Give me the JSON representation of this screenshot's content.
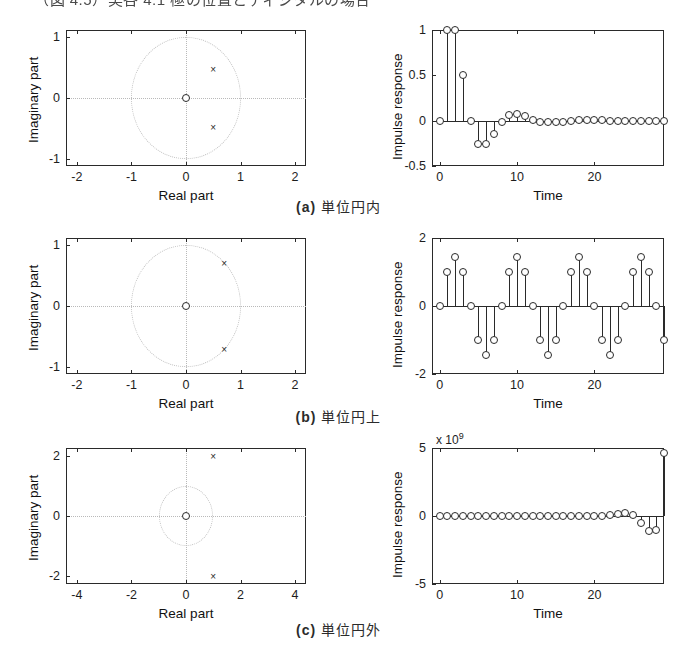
{
  "page": {
    "top_caption": "（図 4.5）実各 4.1 極の位置とディジタルの場合"
  },
  "panels": [
    {
      "id": "a",
      "caption_tag": "(a)",
      "caption_text": "単位円内",
      "pole_zero": {
        "xlabel": "Real part",
        "ylabel": "Imaginary part",
        "xlim": [
          -2.2,
          2.2
        ],
        "ylim": [
          -1.12,
          1.12
        ],
        "xticks": [
          -2,
          -1,
          0,
          1,
          2
        ],
        "xticklabels": [
          "-2",
          "-1",
          "0",
          "1",
          "2"
        ],
        "yticks": [
          -1,
          0,
          1
        ],
        "yticklabels": [
          "-1",
          "0",
          "1"
        ],
        "unit_circle_radius": 1,
        "zeros": [
          [
            0,
            0
          ]
        ],
        "poles": [
          [
            0.5,
            0.48
          ],
          [
            0.5,
            -0.48
          ]
        ]
      },
      "impulse": {
        "xlabel": "Time",
        "ylabel": "Impulse response",
        "xlim": [
          -1,
          29
        ],
        "ylim": [
          -0.5,
          1.0
        ],
        "xticks": [
          0,
          10,
          20
        ],
        "xticklabels": [
          "0",
          "10",
          "20"
        ],
        "yticks": [
          -0.5,
          0,
          0.5,
          1
        ],
        "yticklabels": [
          "-0.5",
          "0",
          "0.5",
          "1"
        ],
        "multiplier": "",
        "values": [
          0,
          1.0,
          1.0,
          0.5,
          0.0,
          -0.26,
          -0.26,
          -0.15,
          -0.02,
          0.06,
          0.075,
          0.055,
          0.01,
          -0.01,
          -0.02,
          -0.02,
          -0.01,
          0.0,
          0.005,
          0.006,
          0.005,
          0.002,
          0.0,
          0.0,
          0.0,
          0.0,
          0.0,
          0.0,
          0.0,
          0.0
        ]
      }
    },
    {
      "id": "b",
      "caption_tag": "(b)",
      "caption_text": "単位円上",
      "pole_zero": {
        "xlabel": "Real part",
        "ylabel": "Imaginary part",
        "xlim": [
          -2.2,
          2.2
        ],
        "ylim": [
          -1.12,
          1.12
        ],
        "xticks": [
          -2,
          -1,
          0,
          1,
          2
        ],
        "xticklabels": [
          "-2",
          "-1",
          "0",
          "1",
          "2"
        ],
        "yticks": [
          -1,
          0,
          1
        ],
        "yticklabels": [
          "-1",
          "0",
          "1"
        ],
        "unit_circle_radius": 1,
        "zeros": [
          [
            0,
            0
          ]
        ],
        "poles": [
          [
            0.7,
            0.71
          ],
          [
            0.7,
            -0.71
          ]
        ]
      },
      "impulse": {
        "xlabel": "Time",
        "ylabel": "Impulse response",
        "xlim": [
          -1,
          29
        ],
        "ylim": [
          -2,
          2
        ],
        "xticks": [
          0,
          10,
          20
        ],
        "xticklabels": [
          "0",
          "10",
          "20"
        ],
        "yticks": [
          -2,
          0,
          2
        ],
        "yticklabels": [
          "-2",
          "0",
          "2"
        ],
        "multiplier": "",
        "values": [
          0,
          1.0,
          1.45,
          1.0,
          0,
          -1.0,
          -1.45,
          -1.0,
          0,
          1.0,
          1.45,
          1.0,
          0,
          -1.0,
          -1.45,
          -1.0,
          0,
          1.0,
          1.45,
          1.0,
          0,
          -1.0,
          -1.45,
          -1.0,
          0,
          1.0,
          1.45,
          1.0,
          0,
          -1.0
        ]
      }
    },
    {
      "id": "c",
      "caption_tag": "(c)",
      "caption_text": "単位円外",
      "pole_zero": {
        "xlabel": "Real part",
        "ylabel": "Imaginary part",
        "xlim": [
          -4.4,
          4.4
        ],
        "ylim": [
          -2.25,
          2.25
        ],
        "xticks": [
          -4,
          -2,
          0,
          2,
          4
        ],
        "xticklabels": [
          "-4",
          "-2",
          "0",
          "2",
          "4"
        ],
        "yticks": [
          -2,
          0,
          2
        ],
        "yticklabels": [
          "-2",
          "0",
          "2"
        ],
        "unit_circle_radius": 1,
        "zeros": [
          [
            0,
            0
          ]
        ],
        "poles": [
          [
            1.0,
            2.0
          ],
          [
            1.0,
            -2.0
          ]
        ]
      },
      "impulse": {
        "xlabel": "Time",
        "ylabel": "Impulse response",
        "xlim": [
          -1,
          29
        ],
        "ylim": [
          -5,
          5
        ],
        "xticks": [
          0,
          10,
          20
        ],
        "xticklabels": [
          "0",
          "10",
          "20"
        ],
        "yticks": [
          -5,
          0,
          5
        ],
        "yticklabels": [
          "-5",
          "0",
          "5"
        ],
        "multiplier_prefix": "x 10",
        "multiplier_exponent": "9",
        "values": [
          0,
          0,
          0,
          0,
          0,
          0,
          0,
          0,
          0,
          0,
          0,
          0,
          0,
          0,
          0,
          0,
          0,
          0,
          0,
          0,
          0.02,
          0.03,
          0.06,
          0.12,
          0.22,
          0.05,
          -0.55,
          -1.1,
          -1.05,
          4.65
        ]
      }
    }
  ],
  "chart_data": {
    "type": "scatter",
    "subplots": [
      {
        "name": "a-pole-zero",
        "type": "scatter",
        "xlabel": "Real part",
        "ylabel": "Imaginary part",
        "xlim": [
          -2.2,
          2.2
        ],
        "ylim": [
          -1.12,
          1.12
        ],
        "poles_x": [
          0.5,
          0.5
        ],
        "poles_y": [
          0.48,
          -0.48
        ],
        "zeros_x": [
          0
        ],
        "zeros_y": [
          0
        ],
        "unit_circle": true
      },
      {
        "name": "a-impulse",
        "type": "line",
        "xlabel": "Time",
        "ylabel": "Impulse response",
        "x": [
          0,
          1,
          2,
          3,
          4,
          5,
          6,
          7,
          8,
          9,
          10,
          11,
          12,
          13,
          14,
          15,
          16,
          17,
          18,
          19,
          20,
          21,
          22,
          23,
          24,
          25,
          26,
          27,
          28,
          29
        ],
        "values": [
          0,
          1.0,
          1.0,
          0.5,
          0.0,
          -0.26,
          -0.26,
          -0.15,
          -0.02,
          0.06,
          0.075,
          0.055,
          0.01,
          -0.01,
          -0.02,
          -0.02,
          -0.01,
          0.0,
          0.005,
          0.006,
          0.005,
          0.002,
          0,
          0,
          0,
          0,
          0,
          0,
          0,
          0
        ],
        "ylim": [
          -0.5,
          1.0
        ]
      },
      {
        "name": "b-pole-zero",
        "type": "scatter",
        "xlabel": "Real part",
        "ylabel": "Imaginary part",
        "xlim": [
          -2.2,
          2.2
        ],
        "ylim": [
          -1.12,
          1.12
        ],
        "poles_x": [
          0.7,
          0.7
        ],
        "poles_y": [
          0.71,
          -0.71
        ],
        "zeros_x": [
          0
        ],
        "zeros_y": [
          0
        ],
        "unit_circle": true
      },
      {
        "name": "b-impulse",
        "type": "line",
        "xlabel": "Time",
        "ylabel": "Impulse response",
        "x": [
          0,
          1,
          2,
          3,
          4,
          5,
          6,
          7,
          8,
          9,
          10,
          11,
          12,
          13,
          14,
          15,
          16,
          17,
          18,
          19,
          20,
          21,
          22,
          23,
          24,
          25,
          26,
          27,
          28,
          29
        ],
        "values": [
          0,
          1.0,
          1.45,
          1.0,
          0,
          -1.0,
          -1.45,
          -1.0,
          0,
          1.0,
          1.45,
          1.0,
          0,
          -1.0,
          -1.45,
          -1.0,
          0,
          1.0,
          1.45,
          1.0,
          0,
          -1.0,
          -1.45,
          -1.0,
          0,
          1.0,
          1.45,
          1.0,
          0,
          -1.0
        ],
        "ylim": [
          -2,
          2
        ]
      },
      {
        "name": "c-pole-zero",
        "type": "scatter",
        "xlabel": "Real part",
        "ylabel": "Imaginary part",
        "xlim": [
          -4.4,
          4.4
        ],
        "ylim": [
          -2.25,
          2.25
        ],
        "poles_x": [
          1.0,
          1.0
        ],
        "poles_y": [
          2.0,
          -2.0
        ],
        "zeros_x": [
          0
        ],
        "zeros_y": [
          0
        ],
        "unit_circle": true
      },
      {
        "name": "c-impulse",
        "type": "line",
        "xlabel": "Time",
        "ylabel": "Impulse response",
        "x": [
          0,
          1,
          2,
          3,
          4,
          5,
          6,
          7,
          8,
          9,
          10,
          11,
          12,
          13,
          14,
          15,
          16,
          17,
          18,
          19,
          20,
          21,
          22,
          23,
          24,
          25,
          26,
          27,
          28,
          29
        ],
        "values": [
          0,
          0,
          0,
          0,
          0,
          0,
          0,
          0,
          0,
          0,
          0,
          0,
          0,
          0,
          0,
          0,
          0,
          0,
          0,
          0,
          0.02,
          0.03,
          0.06,
          0.12,
          0.22,
          0.05,
          -0.55,
          -1.1,
          -1.05,
          4.65
        ],
        "ylim": [
          -5,
          5
        ],
        "scale": "x 10^9"
      }
    ]
  }
}
